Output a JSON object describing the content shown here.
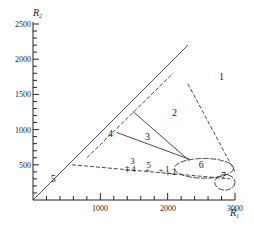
{
  "chart_data": {
    "type": "scatter",
    "title": "",
    "xlabel": "R1",
    "ylabel": "R2",
    "xlim": [
      0,
      3000
    ],
    "ylim": [
      0,
      2500
    ],
    "x_ticks": [
      1000,
      2000,
      3000
    ],
    "y_ticks": [
      500,
      1000,
      1500,
      2000,
      2500
    ],
    "grid": false,
    "legend": null,
    "region_labels": [
      {
        "label": "1",
        "x": 2800,
        "y": 1700
      },
      {
        "label": "2",
        "x": 2100,
        "y": 1200
      },
      {
        "label": "3",
        "x": 1700,
        "y": 850
      },
      {
        "label": "4",
        "x": 1150,
        "y": 900
      },
      {
        "label": "5",
        "x": 300,
        "y": 250
      },
      {
        "label": "6",
        "x": 2500,
        "y": 450
      },
      {
        "label": "7",
        "x": 2830,
        "y": 300
      }
    ],
    "points": [
      {
        "label": "3",
        "x": 1400,
        "y": 470
      },
      {
        "label": "4",
        "x": 1400,
        "y": 420
      },
      {
        "label": "5",
        "x": 1700,
        "y": 420
      },
      {
        "label": "1",
        "x": 1900,
        "y": 420
      },
      {
        "label": "2",
        "x": 2000,
        "y": 380
      }
    ],
    "lines": [
      {
        "name": "diagonal",
        "style": "solid",
        "from": [
          0,
          0
        ],
        "to": [
          2300,
          2200
        ]
      },
      {
        "name": "dashed-parallel",
        "style": "dashed",
        "from": [
          800,
          600
        ],
        "to": [
          2080,
          1800
        ]
      },
      {
        "name": "boundary-1",
        "style": "dashed",
        "from": [
          2300,
          1650
        ],
        "to": [
          3000,
          400
        ]
      },
      {
        "name": "boundary-3",
        "style": "solid",
        "from": [
          1480,
          1260
        ],
        "to": [
          2320,
          560
        ]
      },
      {
        "name": "boundary-4",
        "style": "solid",
        "from": [
          1240,
          960
        ],
        "to": [
          2320,
          580
        ]
      },
      {
        "name": "boundary-5",
        "style": "dashed",
        "from": [
          580,
          500
        ],
        "to": [
          2930,
          300
        ]
      }
    ],
    "ellipses": [
      {
        "label": "6",
        "cx": 2540,
        "cy": 450,
        "rx": 440,
        "ry": 140
      },
      {
        "label": "7",
        "cx": 2850,
        "cy": 250,
        "rx": 150,
        "ry": 110
      }
    ]
  },
  "axes": {
    "x_label_main": "R",
    "x_label_sub": "1",
    "y_label_main": "R",
    "y_label_sub": "2",
    "x_tick_labels": [
      "1000",
      "2000",
      "3000"
    ],
    "y_tick_labels": [
      "500",
      "1000",
      "1500",
      "2000",
      "2500"
    ]
  }
}
